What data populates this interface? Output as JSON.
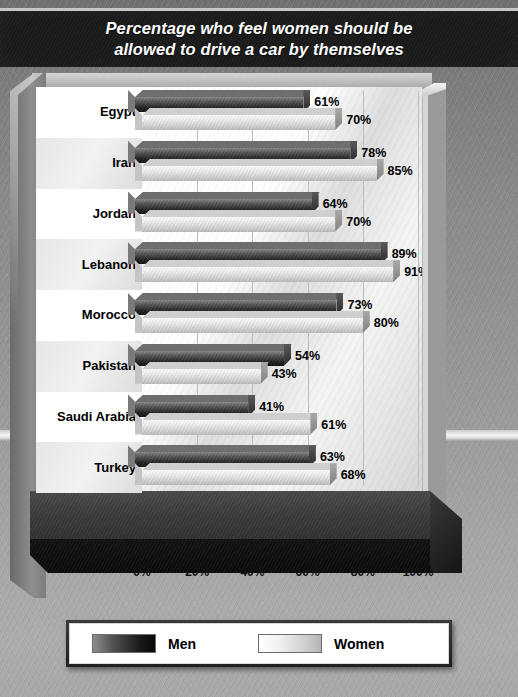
{
  "title": {
    "line1": "Percentage who feel women should be",
    "line2": "allowed to drive a car by themselves"
  },
  "legend": {
    "men_label": "Men",
    "women_label": "Women"
  },
  "axis": {
    "ticks": [
      "0%",
      "20%",
      "40%",
      "60%",
      "80%",
      "100%"
    ]
  },
  "chart_data": {
    "type": "bar",
    "orientation": "horizontal",
    "title": "Percentage who feel women should be allowed to drive a car by themselves",
    "xlabel": "",
    "ylabel": "",
    "xlim": [
      0,
      100
    ],
    "xticks": [
      0,
      20,
      40,
      60,
      80,
      100
    ],
    "xtick_labels": [
      "0%",
      "20%",
      "40%",
      "60%",
      "80%",
      "100%"
    ],
    "grid": true,
    "legend_position": "bottom",
    "categories": [
      "Egypt",
      "Iran",
      "Jordan",
      "Lebanon",
      "Morocco",
      "Pakistan",
      "Saudi Arabia",
      "Turkey"
    ],
    "series": [
      {
        "name": "Men",
        "color": "#1a1a1a",
        "values": [
          61,
          78,
          64,
          89,
          73,
          54,
          41,
          63
        ],
        "labels": [
          "61%",
          "78%",
          "64%",
          "89%",
          "73%",
          "54%",
          "41%",
          "63%"
        ]
      },
      {
        "name": "Women",
        "color": "#e0e0e0",
        "values": [
          70,
          85,
          70,
          91,
          80,
          43,
          61,
          68
        ],
        "labels": [
          "70%",
          "85%",
          "70%",
          "91%",
          "80%",
          "43%",
          "61%",
          "68%"
        ]
      }
    ]
  }
}
